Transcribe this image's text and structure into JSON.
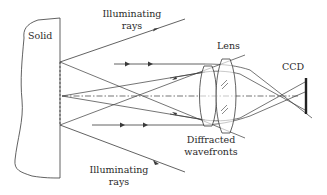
{
  "diagram": {
    "title": "",
    "labels": {
      "solid": "Solid",
      "illuminating_top_line1": "Illuminating",
      "illuminating_top_line2": "rays",
      "lens": "Lens",
      "ccd": "CCD",
      "diffracted_line1": "Diffracted",
      "diffracted_line2": "wavefronts",
      "illuminating_bottom_line1": "Illuminating",
      "illuminating_bottom_line2": "rays"
    },
    "colors": {
      "line": "#3a3a3a",
      "text": "#2b2b2b",
      "background": "#ffffff"
    },
    "components": [
      "Solid",
      "Illuminating rays",
      "Lens",
      "CCD",
      "Diffracted wavefronts"
    ]
  }
}
